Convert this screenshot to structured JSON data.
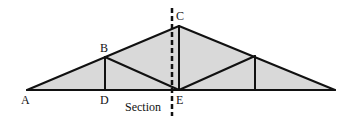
{
  "diagram": {
    "type": "roof-truss",
    "fill_color": "#d9d9d9",
    "line_color": "#111111",
    "labels": {
      "A": "A",
      "B": "B",
      "C": "C",
      "D": "D",
      "E": "E",
      "section": "Section"
    },
    "joints": {
      "A": [
        27,
        90
      ],
      "B": [
        105,
        57
      ],
      "C": [
        179,
        26
      ],
      "D": [
        105,
        90
      ],
      "E": [
        179,
        90
      ],
      "F": [
        255,
        56
      ],
      "G": [
        255,
        90
      ],
      "H": [
        335,
        90
      ]
    },
    "members": [
      [
        "A",
        "B"
      ],
      [
        "B",
        "C"
      ],
      [
        "C",
        "F"
      ],
      [
        "F",
        "H"
      ],
      [
        "A",
        "D"
      ],
      [
        "D",
        "E"
      ],
      [
        "E",
        "G"
      ],
      [
        "G",
        "H"
      ],
      [
        "B",
        "D"
      ],
      [
        "B",
        "E"
      ],
      [
        "C",
        "E"
      ],
      [
        "E",
        "F"
      ],
      [
        "F",
        "G"
      ]
    ],
    "section_line": {
      "x": 172,
      "y1": 8,
      "y2": 116,
      "style": "dashed"
    }
  }
}
